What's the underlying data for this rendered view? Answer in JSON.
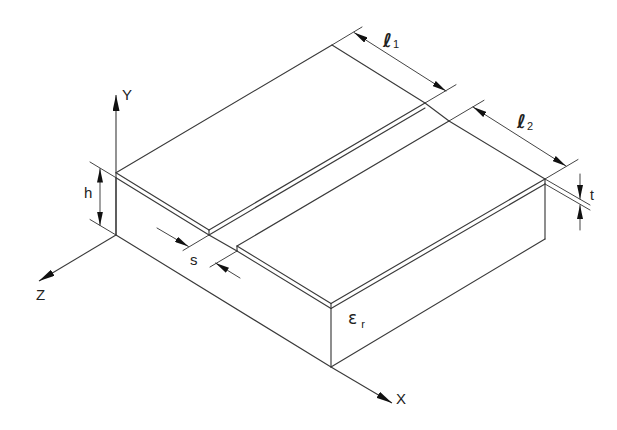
{
  "diagram": {
    "axes": {
      "x": "X",
      "y": "Y",
      "z": "Z"
    },
    "dimensions": {
      "height": "h",
      "gap": "s",
      "thickness": "t",
      "length_1": {
        "symbol": "ℓ",
        "subscript": "1"
      },
      "length_2": {
        "symbol": "ℓ",
        "subscript": "2"
      }
    },
    "substrate": {
      "permittivity": {
        "symbol": "ε",
        "subscript": "r"
      }
    }
  },
  "colors": {
    "background": "#ffffff",
    "line": "#3a3a3a",
    "arrow": "#111111",
    "text": "#222222"
  }
}
